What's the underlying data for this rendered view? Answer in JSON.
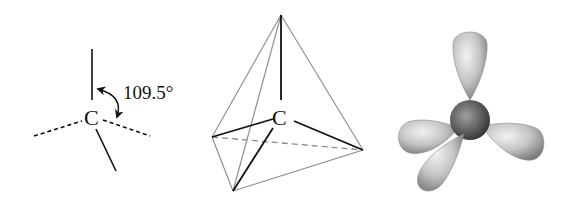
{
  "figures": [
    {
      "id": "dash-wedge",
      "description": "Tetrahedral carbon bond diagram with bond angle",
      "atom": "C",
      "angle_label": "109.5°"
    },
    {
      "id": "tetrahedron",
      "description": "Carbon at center of a tetrahedron",
      "atom": "C"
    },
    {
      "id": "sp3-orbitals",
      "description": "Four sp3 hybrid orbital lobes around a central nucleus"
    }
  ],
  "colors": {
    "bond": "#111111",
    "edge": "#8a8a8a",
    "hidden_edge": "#8a8a8a",
    "lobe_light": "#e8e8e8",
    "lobe_dark": "#7a7a7a",
    "nucleus_light": "#9a9a9a",
    "nucleus_dark": "#3a3a3a"
  }
}
